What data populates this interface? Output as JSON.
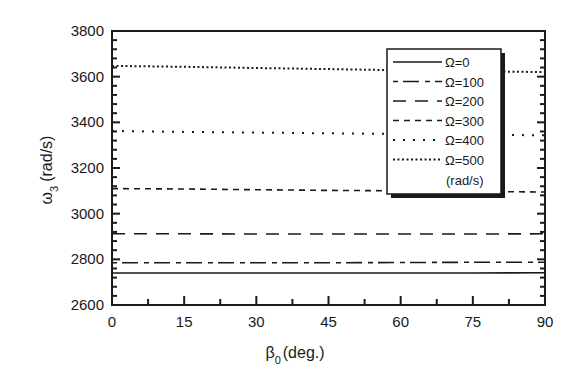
{
  "chart_data": {
    "type": "line",
    "title": "",
    "xlabel": "β0 (deg.)",
    "xlabel_main": "β",
    "xlabel_sub": "0",
    "xlabel_rest": "(deg.)",
    "ylabel": "ω3 (rad/s)",
    "ylabel_main": "ω",
    "ylabel_sub": "3",
    "ylabel_rest": "(rad/s)",
    "xlim": [
      0,
      90
    ],
    "ylim": [
      2600,
      3800
    ],
    "xticks": [
      0,
      15,
      30,
      45,
      60,
      75,
      90
    ],
    "xtick_labels": [
      "0",
      "15",
      "30",
      "45",
      "60",
      "75",
      "90"
    ],
    "yticks": [
      2600,
      2800,
      3000,
      3200,
      3400,
      3600,
      3800
    ],
    "ytick_labels": [
      "2600",
      "2800",
      "3000",
      "3200",
      "3400",
      "3600",
      "3800"
    ],
    "grid": false,
    "legend_position": "upper right (inside)",
    "legend_unit_note": "(rad/s)",
    "x": [
      0,
      15,
      30,
      45,
      60,
      75,
      90
    ],
    "series": [
      {
        "name": "Ω=0",
        "style": "solid",
        "values": [
          2740,
          2740,
          2740,
          2740,
          2740,
          2740,
          2741
        ]
      },
      {
        "name": "Ω=100",
        "style": "dash-dot-long",
        "values": [
          2785,
          2785,
          2785,
          2785,
          2786,
          2787,
          2787
        ]
      },
      {
        "name": "Ω=200",
        "style": "long-dash",
        "values": [
          2912,
          2912,
          2911,
          2911,
          2911,
          2911,
          2912
        ]
      },
      {
        "name": "Ω=300",
        "style": "short-dash",
        "values": [
          3110,
          3108,
          3105,
          3102,
          3100,
          3097,
          3095
        ]
      },
      {
        "name": "Ω=400",
        "style": "dotted-sparse",
        "values": [
          3362,
          3358,
          3355,
          3352,
          3349,
          3346,
          3343
        ]
      },
      {
        "name": "Ω=500",
        "style": "dotted-dense",
        "values": [
          3647,
          3643,
          3638,
          3633,
          3628,
          3624,
          3620
        ]
      }
    ]
  },
  "legend": {
    "items": [
      "Ω=0",
      "Ω=100",
      "Ω=200",
      "Ω=300",
      "Ω=400",
      "Ω=500"
    ],
    "unit": "(rad/s)"
  },
  "colors": {
    "line": "#1a1a1a",
    "background": "#ffffff",
    "shadow": "#1a1a1a"
  }
}
